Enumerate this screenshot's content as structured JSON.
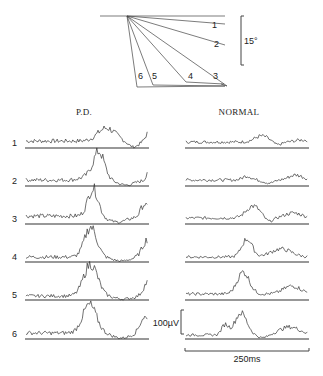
{
  "angle_diagram": {
    "labels": [
      "1",
      "2",
      "3",
      "4",
      "5",
      "6"
    ],
    "angle_scale_label": "15°",
    "angle_scale_value_deg": 15
  },
  "panels": {
    "left": {
      "title": "P.D.",
      "row_labels": [
        "1",
        "2",
        "3",
        "4",
        "5",
        "6"
      ],
      "description": "EMG bursts increasing in amplitude, large central burst each trial"
    },
    "right": {
      "title": "NORMAL",
      "description": "low-amplitude EMG with small central bursts"
    }
  },
  "scale_bars": {
    "amplitude_label": "100µV",
    "amplitude_value_uv": 100,
    "time_label": "250ms",
    "time_value_ms": 250
  }
}
